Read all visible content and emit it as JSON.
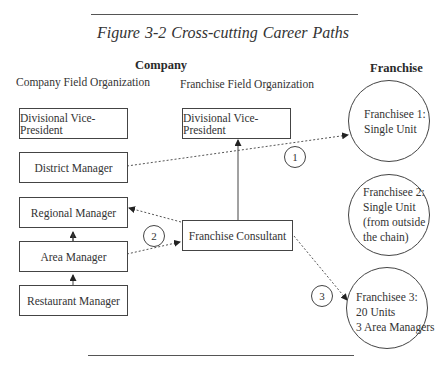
{
  "figure": {
    "title": "Figure 3-2   Cross-cutting Career Paths",
    "headings": {
      "company": "Company",
      "franchise": "Franchise"
    },
    "subheadings": {
      "company_field": "Company Field Organization",
      "franchise_field": "Franchise Field Organization"
    }
  },
  "company_hierarchy": [
    {
      "id": "dvp",
      "label": "Divisional Vice-President"
    },
    {
      "id": "district",
      "label": "District Manager"
    },
    {
      "id": "regional",
      "label": "Regional Manager"
    },
    {
      "id": "area",
      "label": "Area Manager"
    },
    {
      "id": "restaurant",
      "label": "Restaurant Manager"
    }
  ],
  "franchise_hierarchy": [
    {
      "id": "fdvp",
      "label": "Divisional Vice-President"
    },
    {
      "id": "consultant",
      "label": "Franchise Consultant"
    }
  ],
  "franchisees": [
    {
      "id": "f1",
      "lines": [
        "Franchisee 1:",
        "Single Unit"
      ]
    },
    {
      "id": "f2",
      "lines": [
        "Franchisee 2:",
        "Single Unit",
        "(from outside",
        "the chain)"
      ]
    },
    {
      "id": "f3",
      "lines": [
        "Franchisee 3:",
        "20 Units",
        "3 Area Managers"
      ]
    }
  ],
  "paths": [
    {
      "number": "1",
      "from": "District Manager",
      "to": "Franchisee 1: Single Unit",
      "style": "dotted"
    },
    {
      "number": "2",
      "from": "Area Manager",
      "to": "Franchise Consultant",
      "style": "dotted"
    },
    {
      "number": "2",
      "from": "Franchise Consultant",
      "to": "Regional Manager",
      "style": "dotted"
    },
    {
      "number": "3",
      "from": "Franchise Consultant",
      "to": "Franchisee 3: 20 Units, 3 Area Managers",
      "style": "dotted"
    }
  ],
  "path_labels": [
    "1",
    "2",
    "3"
  ]
}
